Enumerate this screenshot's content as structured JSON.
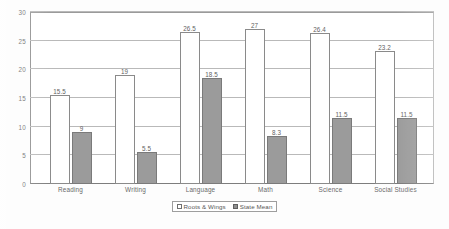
{
  "chart_data": {
    "type": "bar",
    "title": "",
    "subtitle": "",
    "xlabel": "",
    "ylabel": "",
    "ylim": [
      0,
      30
    ],
    "yticks": [
      0,
      5,
      10,
      15,
      20,
      25,
      30
    ],
    "ytick_labels": [
      "0",
      "5",
      "10",
      "15",
      "20",
      "25",
      "30"
    ],
    "grid": true,
    "legend_position": "bottom-center",
    "categories": [
      "Reading",
      "Writing",
      "Language",
      "Math",
      "Science",
      "Social Studies"
    ],
    "series": [
      {
        "name": "Roots & Wings",
        "color": "#ffffff",
        "values": [
          15.5,
          19,
          26.5,
          27,
          26.4,
          23.2
        ],
        "value_labels": [
          "15.5",
          "19",
          "26.5",
          "27",
          "26.4",
          "23.2"
        ]
      },
      {
        "name": "State Mean",
        "color": "#9b9b9b",
        "values": [
          9,
          5.5,
          18.5,
          8.3,
          11.5,
          11.5
        ],
        "value_labels": [
          "9",
          "5.5",
          "18.5",
          "8.3",
          "11.5",
          "11.5"
        ]
      }
    ]
  },
  "legend": {
    "entries": [
      {
        "label": "Roots & Wings",
        "swatch": "hollow-white-square"
      },
      {
        "label": "State Mean",
        "swatch": "filled-gray-square"
      }
    ]
  }
}
